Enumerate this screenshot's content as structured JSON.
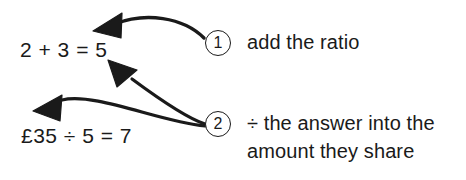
{
  "diagram": {
    "background_color": "#ffffff",
    "ink_color": "#1a1a1a",
    "equations": [
      {
        "id": "sum",
        "text": "2 + 3 = 5"
      },
      {
        "id": "divide",
        "text": "£35 ÷ 5 = 7"
      }
    ],
    "steps": [
      {
        "marker": "1",
        "caption_lines": [
          "add the ratio"
        ],
        "points_to": "sum"
      },
      {
        "marker": "2",
        "caption_lines": [
          "÷ the answer into the",
          "amount they share"
        ],
        "points_to": "sum and divide"
      }
    ]
  }
}
